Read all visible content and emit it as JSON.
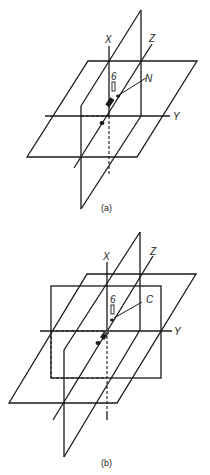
{
  "figure": {
    "panels": [
      {
        "id": "a",
        "caption": "(a)",
        "axis_labels": {
          "x": "X",
          "y": "Y",
          "z": "Z"
        },
        "annotation": "N",
        "element_symbol": "6"
      },
      {
        "id": "b",
        "caption": "(b)",
        "axis_labels": {
          "x": "X",
          "y": "Y",
          "z": "Z"
        },
        "annotation": "C",
        "element_symbol": "6"
      }
    ],
    "colors": {
      "line": "#1a1a1a",
      "background": "#ffffff"
    }
  }
}
